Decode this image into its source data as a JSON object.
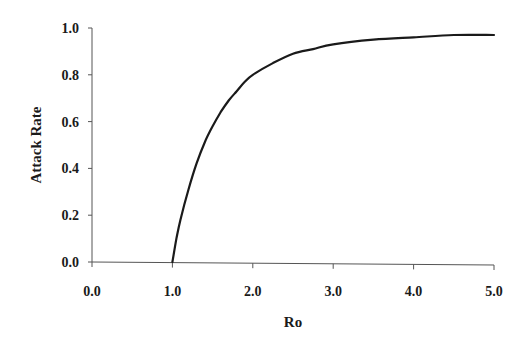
{
  "chart_data": {
    "type": "line",
    "title": "",
    "xlabel": "Ro",
    "ylabel": "Attack Rate",
    "xlim": [
      0.0,
      5.0
    ],
    "ylim": [
      0.0,
      1.0
    ],
    "grid": false,
    "legend": null,
    "x_ticks": [
      "0.0",
      "1.0",
      "2.0",
      "3.0",
      "4.0",
      "5.0"
    ],
    "y_ticks": [
      "0.0",
      "0.2",
      "0.4",
      "0.6",
      "0.8",
      "1.0"
    ],
    "series": [
      {
        "name": "Attack Rate",
        "color": "#1a1a1a",
        "x": [
          1.0,
          1.05,
          1.1,
          1.2,
          1.3,
          1.4,
          1.5,
          1.6,
          1.7,
          1.8,
          1.9,
          2.0,
          2.25,
          2.5,
          2.75,
          3.0,
          3.5,
          4.0,
          4.5,
          5.0
        ],
        "values": [
          0.0,
          0.1,
          0.18,
          0.31,
          0.42,
          0.51,
          0.58,
          0.64,
          0.69,
          0.73,
          0.77,
          0.8,
          0.85,
          0.89,
          0.91,
          0.93,
          0.95,
          0.96,
          0.97,
          0.97
        ]
      }
    ]
  }
}
